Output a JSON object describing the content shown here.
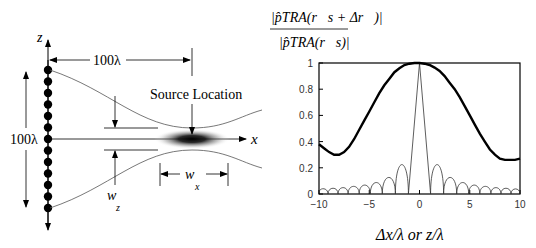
{
  "left_diagram": {
    "z_axis_label": "z",
    "x_axis_label": "x",
    "horizontal_distance_label": "100λ",
    "vertical_aperture_label": "100λ",
    "source_label": "Source Location",
    "wz_label_main": "w",
    "wz_label_sub": "z",
    "wx_label_main": "w",
    "wx_label_sub": "x",
    "array_element_count": 13
  },
  "chart_data": {
    "type": "line",
    "title": "",
    "ylabel": "|p̂_TRA(r_s + Δr)| / |p̂_TRA(r_s)|",
    "ylabel_parts": {
      "numerator": "|p̂TRA(r⃗s + Δr⃗)|",
      "denominator": "|p̂TRA(r⃗s)|"
    },
    "xlabel": "Δx/λ  or  z/λ",
    "xlim": [
      -10,
      10
    ],
    "ylim": [
      0,
      1
    ],
    "xticks": [
      -10,
      -5,
      0,
      5,
      10
    ],
    "yticks": [
      0,
      0.2,
      0.4,
      0.6,
      0.8,
      1
    ],
    "ytick_labels": [
      "0",
      "0.2",
      "0.4",
      "0.6",
      "0.8",
      "1"
    ],
    "xtick_labels": [
      "−10",
      "−5",
      "0",
      "5",
      "10"
    ],
    "grid": false,
    "legend": null,
    "series": [
      {
        "name": "thick (z/λ, cross-range along array axis)",
        "style": "thick",
        "x": [
          -10,
          -9.5,
          -9,
          -8.5,
          -8,
          -7.5,
          -7,
          -6.5,
          -6,
          -5.5,
          -5,
          -4.5,
          -4,
          -3.5,
          -3,
          -2.5,
          -2,
          -1.5,
          -1,
          -0.5,
          0,
          0.5,
          1,
          1.5,
          2,
          2.5,
          3,
          3.5,
          4,
          4.5,
          5,
          5.5,
          6,
          6.5,
          7,
          7.5,
          8,
          8.5,
          9,
          9.5,
          10
        ],
        "y": [
          0.38,
          0.35,
          0.32,
          0.3,
          0.3,
          0.32,
          0.36,
          0.42,
          0.49,
          0.56,
          0.63,
          0.7,
          0.77,
          0.83,
          0.88,
          0.93,
          0.96,
          0.985,
          0.995,
          1.0,
          1.0,
          0.995,
          0.985,
          0.965,
          0.94,
          0.9,
          0.85,
          0.8,
          0.74,
          0.67,
          0.6,
          0.53,
          0.46,
          0.4,
          0.34,
          0.3,
          0.27,
          0.26,
          0.26,
          0.26,
          0.27
        ]
      },
      {
        "name": "thin (Δx/λ, range)",
        "style": "thin",
        "main_lobe_null": 1.1,
        "sidelobes": [
          {
            "x": -9.6,
            "y": 0.04
          },
          {
            "x": -8.6,
            "y": 0.045
          },
          {
            "x": -7.6,
            "y": 0.05
          },
          {
            "x": -6.5,
            "y": 0.06
          },
          {
            "x": -5.4,
            "y": 0.07
          },
          {
            "x": -4.3,
            "y": 0.09
          },
          {
            "x": -3.1,
            "y": 0.13
          },
          {
            "x": -1.6,
            "y": 0.23
          },
          {
            "x": 1.6,
            "y": 0.23
          },
          {
            "x": 3.1,
            "y": 0.13
          },
          {
            "x": 4.3,
            "y": 0.09
          },
          {
            "x": 5.4,
            "y": 0.07
          },
          {
            "x": 6.5,
            "y": 0.06
          },
          {
            "x": 7.6,
            "y": 0.05
          },
          {
            "x": 8.6,
            "y": 0.045
          },
          {
            "x": 9.6,
            "y": 0.04
          }
        ],
        "nulls": [
          -10,
          -9.1,
          -8.1,
          -7.1,
          -6.0,
          -4.9,
          -3.7,
          -2.4,
          -1.1,
          1.1,
          2.4,
          3.7,
          4.9,
          6.0,
          7.1,
          8.1,
          9.1,
          10
        ]
      }
    ]
  }
}
